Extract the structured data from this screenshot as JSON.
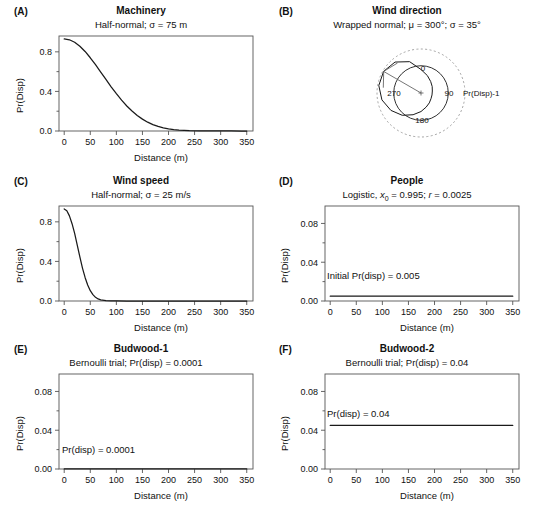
{
  "figure": {
    "panel_count": 6,
    "axis_color": "#555555",
    "curve_color": "#1a1a1a",
    "dashed_color": "#9a9a9a"
  },
  "panels": {
    "a": {
      "letter": "(A)",
      "title": "Machinery",
      "subtitle_pre": "Half-normal; ",
      "subtitle_sigma": "σ = 75 m",
      "xlabel": "Distance (m)",
      "ylabel": "Pr(Disp)"
    },
    "b": {
      "letter": "(B)",
      "title": "Wind direction",
      "subtitle": "Wrapped normal; μ = 300°; σ = 35°",
      "dir_0": "0",
      "dir_90": "90",
      "dir_180": "180",
      "dir_270": "270",
      "radial_label": "Pr(Disp)-1"
    },
    "c": {
      "letter": "(C)",
      "title": "Wind speed",
      "subtitle": "Half-normal; σ = 25 m/s",
      "xlabel": "Distance (m)",
      "ylabel": "Pr(Disp)"
    },
    "d": {
      "letter": "(D)",
      "title": "People",
      "subtitle_full": "Logistic, x0 = 0.995; r = 0.0025",
      "xlabel": "Distance (m)",
      "ylabel": "Pr(Disp)",
      "annotation": "Initial Pr(disp) = 0.005"
    },
    "e": {
      "letter": "(E)",
      "title": "Budwood-1",
      "subtitle": "Bernoulli trial; Pr(disp) = 0.0001",
      "xlabel": "Distance (m)",
      "ylabel": "Pr(Disp)",
      "annotation": "Pr(disp) = 0.0001"
    },
    "f": {
      "letter": "(F)",
      "title": "Budwood-2",
      "subtitle": "Bernoulli trial; Pr(disp) = 0.04",
      "xlabel": "Distance (m)",
      "ylabel": "Pr(Disp)",
      "annotation": "Pr(disp) = 0.04"
    }
  },
  "chart_data": [
    {
      "panel": "A",
      "type": "line",
      "title": "Machinery",
      "subtitle": "Half-normal; σ = 75 m",
      "xlabel": "Distance (m)",
      "ylabel": "Pr(Disp)",
      "xlim": [
        -10,
        362
      ],
      "ylim": [
        0,
        0.96
      ],
      "xticks": [
        0,
        50,
        100,
        150,
        200,
        250,
        300,
        350
      ],
      "yticks": [
        0.0,
        0.4,
        0.8
      ],
      "yticklabels": [
        "0.0",
        "0.4",
        "0.8"
      ],
      "ytick_minor": [
        0.2,
        0.6
      ],
      "model": "half-normal",
      "sigma": 75,
      "amplitude": 0.93,
      "x": [
        0,
        10,
        20,
        30,
        40,
        50,
        60,
        70,
        80,
        90,
        100,
        110,
        120,
        130,
        140,
        150,
        160,
        170,
        180,
        190,
        200,
        210,
        220,
        230,
        240,
        260,
        280,
        300,
        320,
        340,
        350
      ],
      "y": [
        0.93,
        0.922,
        0.897,
        0.857,
        0.804,
        0.74,
        0.67,
        0.596,
        0.521,
        0.447,
        0.377,
        0.312,
        0.253,
        0.202,
        0.157,
        0.12,
        0.089,
        0.065,
        0.046,
        0.032,
        0.022,
        0.014,
        0.009,
        0.006,
        0.003,
        0.001,
        0.0005,
        0.0002,
        0.0001,
        0.0,
        0.0
      ]
    },
    {
      "panel": "B",
      "type": "line",
      "coordinate_system": "polar",
      "title": "Wind direction",
      "subtitle": "Wrapped normal; μ = 300°; σ = 35°",
      "radial_label": "Pr(Disp)-1",
      "direction_labels": [
        "0",
        "90",
        "180",
        "270"
      ],
      "mu_deg": 300,
      "sigma_deg": 35,
      "reference_circle": "dashed unit circle",
      "mean_vector_arrow_deg": 300,
      "theta_deg": [
        0,
        20,
        40,
        60,
        80,
        100,
        120,
        140,
        160,
        180,
        200,
        220,
        240,
        260,
        280,
        300,
        320,
        340
      ],
      "r": [
        0.44,
        0.3,
        0.2,
        0.14,
        0.1,
        0.09,
        0.1,
        0.14,
        0.2,
        0.3,
        0.43,
        0.6,
        0.76,
        0.9,
        0.99,
        1.0,
        0.92,
        0.72
      ]
    },
    {
      "panel": "C",
      "type": "line",
      "title": "Wind speed",
      "subtitle": "Half-normal; σ = 25 m/s",
      "xlabel": "Distance (m)",
      "ylabel": "Pr(Disp)",
      "xlim": [
        -10,
        362
      ],
      "ylim": [
        0,
        0.96
      ],
      "xticks": [
        0,
        50,
        100,
        150,
        200,
        250,
        300,
        350
      ],
      "yticks": [
        0.0,
        0.4,
        0.8
      ],
      "yticklabels": [
        "0.0",
        "0.4",
        "0.8"
      ],
      "ytick_minor": [
        0.2,
        0.6
      ],
      "model": "half-normal",
      "sigma": 25,
      "amplitude": 0.93,
      "x": [
        0,
        5,
        10,
        15,
        20,
        25,
        30,
        35,
        40,
        45,
        50,
        55,
        60,
        65,
        70,
        80,
        90,
        100,
        120,
        150,
        200,
        250,
        300,
        350
      ],
      "y": [
        0.93,
        0.912,
        0.86,
        0.781,
        0.683,
        0.564,
        0.446,
        0.333,
        0.238,
        0.161,
        0.104,
        0.064,
        0.037,
        0.021,
        0.011,
        0.003,
        0.001,
        0.0003,
        0.0,
        0.0,
        0.0,
        0.0,
        0.0,
        0.0
      ]
    },
    {
      "panel": "D",
      "type": "line",
      "title": "People",
      "subtitle": "Logistic, x0 = 0.995; r = 0.0025",
      "xlabel": "Distance (m)",
      "ylabel": "Pr(Disp)",
      "xlim": [
        -10,
        362
      ],
      "ylim": [
        0,
        0.098
      ],
      "xticks": [
        0,
        50,
        100,
        150,
        200,
        250,
        300,
        350
      ],
      "yticks": [
        0.0,
        0.04,
        0.08
      ],
      "yticklabels": [
        "0.00",
        "0.04",
        "0.08"
      ],
      "ytick_minor": [
        0.02,
        0.06
      ],
      "model": "logistic",
      "x0": 0.995,
      "r": 0.0025,
      "annotation": "Initial Pr(disp) = 0.005",
      "constant_value": 0.005,
      "x": [
        0,
        350
      ],
      "y": [
        0.005,
        0.005
      ]
    },
    {
      "panel": "E",
      "type": "line",
      "title": "Budwood-1",
      "subtitle": "Bernoulli trial; Pr(disp) = 0.0001",
      "xlabel": "Distance (m)",
      "ylabel": "Pr(Disp)",
      "xlim": [
        -10,
        362
      ],
      "ylim": [
        0,
        0.098
      ],
      "xticks": [
        0,
        50,
        100,
        150,
        200,
        250,
        300,
        350
      ],
      "yticks": [
        0.0,
        0.04,
        0.08
      ],
      "yticklabels": [
        "0.00",
        "0.04",
        "0.08"
      ],
      "ytick_minor": [
        0.02,
        0.06
      ],
      "model": "bernoulli",
      "annotation": "Pr(disp) = 0.0001",
      "constant_value": 0.0001,
      "x": [
        0,
        350
      ],
      "y": [
        0.0001,
        0.0001
      ]
    },
    {
      "panel": "F",
      "type": "line",
      "title": "Budwood-2",
      "subtitle": "Bernoulli trial; Pr(disp) = 0.04",
      "xlabel": "Distance (m)",
      "ylabel": "Pr(Disp)",
      "xlim": [
        -10,
        362
      ],
      "ylim": [
        0,
        0.098
      ],
      "xticks": [
        0,
        50,
        100,
        150,
        200,
        250,
        300,
        350
      ],
      "yticks": [
        0.0,
        0.04,
        0.08
      ],
      "yticklabels": [
        "0.00",
        "0.04",
        "0.08"
      ],
      "ytick_minor": [
        0.02,
        0.06
      ],
      "model": "bernoulli",
      "annotation": "Pr(disp) = 0.04",
      "constant_value": 0.045,
      "x": [
        0,
        350
      ],
      "y": [
        0.045,
        0.045
      ]
    }
  ]
}
